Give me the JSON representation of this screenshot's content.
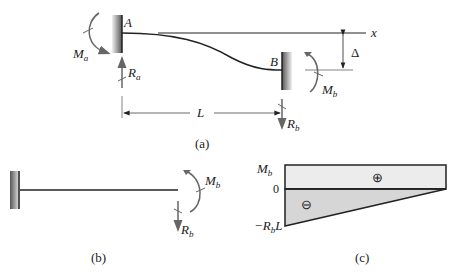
{
  "figure_a": {
    "caption": "(a)",
    "point_a": "A",
    "point_b": "B",
    "axis_label": "x",
    "moment_a": {
      "main": "M",
      "sub": "a"
    },
    "reaction_a": {
      "main": "R",
      "sub": "a"
    },
    "moment_b": {
      "main": "M",
      "sub": "b"
    },
    "reaction_b": {
      "main": "R",
      "sub": "b"
    },
    "span_label": "L",
    "deflection_label": "Δ"
  },
  "figure_b": {
    "caption": "(b)",
    "moment_b": {
      "main": "M",
      "sub": "b"
    },
    "reaction_b": {
      "main": "R",
      "sub": "b"
    }
  },
  "figure_c": {
    "caption": "(c)",
    "top_label": {
      "main": "M",
      "sub": "b"
    },
    "zero_label": "0",
    "bottom_label": {
      "prefix": "−R",
      "sub": "b",
      "suffix": "L"
    },
    "positive_sign": "⊕",
    "negative_sign": "⊖",
    "colors": {
      "positive_fill": "#ececec",
      "negative_fill": "#d6d6d6"
    }
  }
}
